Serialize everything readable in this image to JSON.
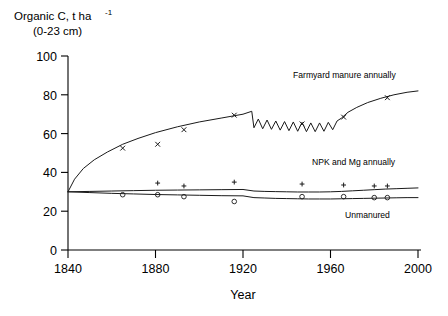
{
  "chart_data": {
    "type": "line",
    "title": "",
    "ylabel_line1": "Organic C, t ha",
    "ylabel_exponent": "-1",
    "ylabel_line2": "(0-23 cm)",
    "xlabel": "Year",
    "xlim": [
      1840,
      2000
    ],
    "ylim": [
      0,
      100
    ],
    "xticks": [
      1840,
      1880,
      1920,
      1960,
      2000
    ],
    "yticks": [
      0,
      20,
      40,
      60,
      80,
      100
    ],
    "grid": false,
    "legend_position": "inline-right",
    "series": [
      {
        "name": "Farmyard manure annually",
        "marker": "cross",
        "label_text": "Farmyard manure annually",
        "line_x": [
          1840,
          1843,
          1847,
          1852,
          1858,
          1865,
          1872,
          1880,
          1890,
          1900,
          1910,
          1920,
          1924,
          1925,
          1927,
          1929,
          1931,
          1933,
          1935,
          1937,
          1939,
          1941,
          1943,
          1945,
          1947,
          1949,
          1951,
          1953,
          1955,
          1957,
          1959,
          1961,
          1963,
          1965,
          1968,
          1972,
          1977,
          1983,
          1989,
          1995,
          2000
        ],
        "line_y": [
          30.0,
          36.5,
          42.0,
          46.5,
          50.5,
          54.5,
          57.5,
          60.5,
          63.5,
          66.0,
          68.0,
          70.0,
          71.5,
          63.0,
          67.5,
          62.5,
          67.0,
          62.2,
          66.5,
          61.8,
          66.2,
          61.5,
          66.0,
          61.2,
          65.8,
          61.0,
          65.5,
          61.0,
          65.5,
          61.2,
          65.8,
          62.0,
          66.5,
          68.0,
          71.0,
          73.5,
          76.0,
          78.2,
          80.0,
          81.3,
          82.0
        ],
        "points_x": [
          1865,
          1881,
          1893,
          1916,
          1947,
          1966,
          1986
        ],
        "points_y": [
          52.5,
          54.5,
          62.0,
          69.5,
          65.0,
          68.5,
          78.5
        ]
      },
      {
        "name": "NPK and Mg annually",
        "marker": "plus",
        "label_text": "NPK and Mg annually",
        "line_x": [
          1840,
          1850,
          1860,
          1870,
          1880,
          1890,
          1900,
          1910,
          1920,
          1925,
          1930,
          1935,
          1940,
          1945,
          1950,
          1955,
          1960,
          1965,
          1970,
          1975,
          1980,
          1985,
          1990,
          1995,
          2000
        ],
        "line_y": [
          30.0,
          30.2,
          30.4,
          30.6,
          30.8,
          30.9,
          31.0,
          31.1,
          31.2,
          30.4,
          30.2,
          30.1,
          30.0,
          29.9,
          29.9,
          29.9,
          30.0,
          30.2,
          30.5,
          30.8,
          31.1,
          31.4,
          31.6,
          31.8,
          32.0
        ],
        "points_x": [
          1881,
          1893,
          1916,
          1947,
          1966,
          1980,
          1986
        ],
        "points_y": [
          34.5,
          33.0,
          35.0,
          34.0,
          33.5,
          33.0,
          33.0
        ]
      },
      {
        "name": "Unmanured",
        "marker": "circle",
        "label_text": "Unmanured",
        "line_x": [
          1840,
          1850,
          1860,
          1870,
          1880,
          1890,
          1900,
          1910,
          1920,
          1925,
          1930,
          1935,
          1940,
          1945,
          1950,
          1955,
          1960,
          1965,
          1970,
          1975,
          1980,
          1985,
          1990,
          1995,
          2000
        ],
        "line_y": [
          30.0,
          29.6,
          29.2,
          28.9,
          28.6,
          28.4,
          28.2,
          28.0,
          27.9,
          27.0,
          26.8,
          26.6,
          26.5,
          26.4,
          26.3,
          26.3,
          26.3,
          26.4,
          26.5,
          26.6,
          26.7,
          26.8,
          26.9,
          27.0,
          27.0
        ],
        "points_x": [
          1865,
          1881,
          1893,
          1916,
          1947,
          1966,
          1980,
          1986
        ],
        "points_y": [
          28.5,
          28.5,
          27.5,
          25.0,
          27.5,
          27.5,
          27.0,
          27.0
        ]
      }
    ]
  },
  "labels": {
    "fym": "Farmyard manure annually",
    "npk": "NPK and Mg annually",
    "unmanured": "Unmanured",
    "xaxis": "Year",
    "y1": "Organic C, t ha",
    "ysup": "-1",
    "y2": "(0-23 cm)",
    "yt0": "0",
    "yt20": "20",
    "yt40": "40",
    "yt60": "60",
    "yt80": "80",
    "yt100": "100",
    "xt1840": "1840",
    "xt1880": "1880",
    "xt1920": "1920",
    "xt1960": "1960",
    "xt2000": "2000"
  },
  "colors": {
    "ink": "#000000",
    "line": "#1a1a1a",
    "background": "#ffffff"
  }
}
